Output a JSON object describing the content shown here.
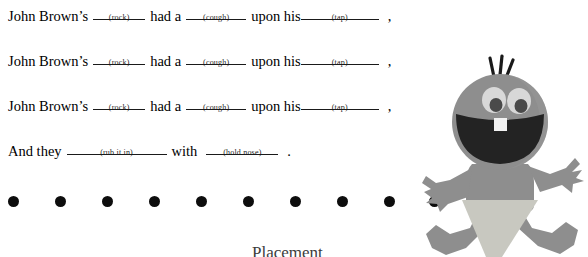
{
  "page": {
    "background_color": "#ffffff",
    "text_color": "#000000"
  },
  "verses": [
    {
      "id": "verse-1",
      "segments": [
        {
          "type": "text",
          "value": "John Brown’s"
        },
        {
          "type": "blank",
          "hint": "(rock)"
        },
        {
          "type": "text",
          "value": "had a"
        },
        {
          "type": "blank",
          "hint": "(cough)"
        },
        {
          "type": "text",
          "value": "upon his"
        },
        {
          "type": "blank",
          "hint": "(tap)"
        },
        {
          "type": "text",
          "value": ","
        }
      ]
    },
    {
      "id": "verse-2",
      "segments": [
        {
          "type": "text",
          "value": "John Brown’s"
        },
        {
          "type": "blank",
          "hint": "(rock)"
        },
        {
          "type": "text",
          "value": "had a"
        },
        {
          "type": "blank",
          "hint": "(cough)"
        },
        {
          "type": "text",
          "value": "upon  his"
        },
        {
          "type": "blank",
          "hint": "(tap)"
        },
        {
          "type": "text",
          "value": ","
        }
      ]
    },
    {
      "id": "verse-3",
      "segments": [
        {
          "type": "text",
          "value": "John Brown’s"
        },
        {
          "type": "blank",
          "hint": "(rock)"
        },
        {
          "type": "text",
          "value": "had a"
        },
        {
          "type": "blank",
          "hint": "(cough)"
        },
        {
          "type": "text",
          "value": "upon  his"
        },
        {
          "type": "blank",
          "hint": "(tap)"
        },
        {
          "type": "text",
          "value": ","
        }
      ]
    },
    {
      "id": "verse-4",
      "segments": [
        {
          "type": "text",
          "value": "And they"
        },
        {
          "type": "blank",
          "hint": "(rub it in)"
        },
        {
          "type": "text",
          "value": "with"
        },
        {
          "type": "blank",
          "hint": "(hold nose)"
        },
        {
          "type": "text",
          "value": "."
        }
      ]
    }
  ],
  "line1": {
    "w1": "John Brown’s",
    "hint1": "(rock)",
    "w2": "had a",
    "hint2": "(cough)",
    "w3": "upon his",
    "hint3": "(tap)",
    "punct": ","
  },
  "line2": {
    "w1": "John Brown’s",
    "hint1": "(rock)",
    "w2": "had a",
    "hint2": "(cough)",
    "w3": "upon  his",
    "hint3": "(tap)",
    "punct": ","
  },
  "line3": {
    "w1": "John Brown’s",
    "hint1": "(rock)",
    "w2": "had a",
    "hint2": "(cough)",
    "w3": "upon  his",
    "hint3": "(tap)",
    "punct": ","
  },
  "line4": {
    "w1": "And they",
    "hint1": "(rub it in)",
    "w2": "with",
    "hint2": "(hold nose)",
    "punct": "."
  },
  "dot_row": {
    "count": 10,
    "color": "#0d0d0d",
    "diameter_px": 11,
    "spacing_px": 47,
    "first_center_x_px": 14
  },
  "clipped_text": {
    "value": "Placement",
    "note_visible": "only the top edge of the glyphs is visible at the image crop"
  },
  "figure": {
    "name": "cartoon-baby",
    "colors": {
      "skin": "#8e8e8e",
      "skin_shade": "#7d7d7d",
      "mouth": "#232323",
      "tooth": "#f2f2f2",
      "eye_white": "#d8d8d8",
      "pupil": "#4a4a4a",
      "hair": "#1a1a1a",
      "diaper": "#c8c8c0"
    },
    "parts": [
      "hair-tufts",
      "head",
      "eyes",
      "open-mouth",
      "tooth",
      "torso",
      "left-arm",
      "right-arm",
      "diaper",
      "left-leg",
      "right-leg"
    ]
  }
}
